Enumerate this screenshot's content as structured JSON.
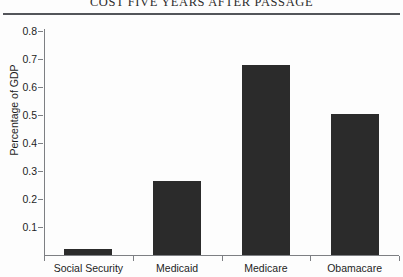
{
  "chart_data": {
    "type": "bar",
    "title": "COST FIVE YEARS AFTER PASSAGE",
    "xlabel": "",
    "ylabel": "Percentage of GDP",
    "categories": [
      "Social Security",
      "Medicaid",
      "Medicare",
      "Obamacare"
    ],
    "values": [
      0.02,
      0.265,
      0.68,
      0.505
    ],
    "ylim": [
      0.0,
      0.8
    ],
    "ytick_labels": [
      "0.8",
      "0.7",
      "0.6",
      "0.5",
      "0.4",
      "0.3",
      "0.2",
      "0.1"
    ],
    "ytick_values": [
      0.8,
      0.7,
      0.6,
      0.5,
      0.4,
      0.3,
      0.2,
      0.1
    ],
    "grid": false,
    "legend": null,
    "bar_color": "#2b2b2b",
    "axis_color": "#7d7f83",
    "text_color": "#1d1d1d"
  }
}
